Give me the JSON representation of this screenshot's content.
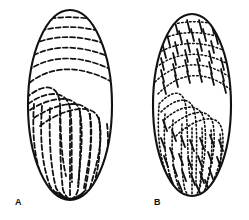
{
  "plate": {
    "background_color": "#ffffff",
    "ink_color": "#111111",
    "width": 249,
    "height": 220,
    "medium": "black-and-white line drawing"
  },
  "figures": [
    {
      "id": "A",
      "label": "A",
      "label_x": 15,
      "label_y": 198,
      "shape": "ellipse",
      "outline_color": "#111111",
      "center_x": 70,
      "center_y": 105,
      "radius_x": 43,
      "radius_y": 96,
      "ornamentation": "oblique dashed striations across the upper half curving into longitudinal dashed striae that converge at the basal point",
      "striation_style": "dashed-beaded",
      "striation_count": 11
    },
    {
      "id": "B",
      "label": "B",
      "label_x": 154,
      "label_y": 198,
      "shape": "ellipse",
      "outline_color": "#111111",
      "center_x": 192,
      "center_y": 105,
      "radius_x": 40,
      "radius_y": 92,
      "ornamentation": "oblique dotted striations crossed by short transverse bars forming a ladder-like reticulum, curving into longitudinal dotted striae converging at the basal point",
      "striation_style": "dotted-with-cross-bars",
      "striation_count": 11
    }
  ]
}
